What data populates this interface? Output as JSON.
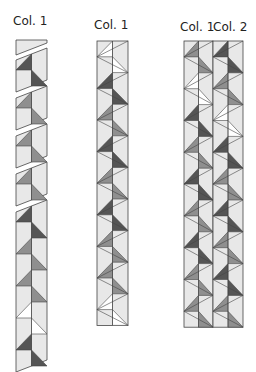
{
  "labels": {
    "strip_a": "Col. 1",
    "strip_b": "Col. 1",
    "strip_c_col1": "Col. 1",
    "strip_c_col2": "Col. 2"
  },
  "colors": {
    "background": "#e8e8e8",
    "dark": "#555555",
    "medium": "#8f8f8f",
    "white": "#ffffff",
    "outline": "#444444"
  },
  "strips": {
    "strip_a": {
      "description": "Col. 1 cut into separated sections",
      "sections": [
        {
          "units": [
            "plain-top"
          ]
        },
        {
          "units": [
            "dark"
          ]
        },
        {
          "units": [
            "medium"
          ]
        },
        {
          "units": [
            "medium"
          ]
        },
        {
          "units": [
            "medium"
          ]
        },
        {
          "units": [
            "dark",
            "medium",
            "medium",
            "white",
            "dark"
          ]
        }
      ]
    },
    "strip_b": {
      "description": "Col. 1 assembled",
      "units": [
        "white",
        "dark",
        "medium",
        "dark",
        "medium",
        "dark",
        "medium",
        "medium",
        "white"
      ]
    },
    "strip_c": {
      "description": "Col. 1 and Col. 2 assembled side by side",
      "col1_units": [
        "medium",
        "white",
        "dark",
        "medium",
        "dark",
        "medium",
        "dark",
        "medium",
        "medium"
      ],
      "col2_units": [
        "dark",
        "medium",
        "white",
        "dark",
        "medium",
        "dark",
        "medium",
        "dark",
        "medium"
      ]
    }
  }
}
